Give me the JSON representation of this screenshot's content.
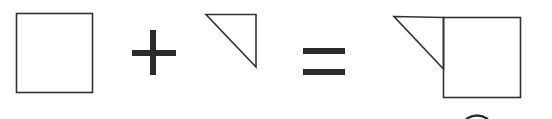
{
  "diagram": {
    "colors": {
      "background": "#ffffff",
      "stroke": "#333333",
      "operator": "#2b2b2b"
    },
    "elements": [
      {
        "id": "square",
        "label": "square",
        "shape": "rect",
        "x": 16,
        "y": 13,
        "w": 76,
        "h": 79
      },
      {
        "id": "plus",
        "label": "+",
        "shape": "plus-sign"
      },
      {
        "id": "triangle",
        "label": "right triangle",
        "shape": "polygon",
        "points": [
          [
            206,
            14
          ],
          [
            256,
            14
          ],
          [
            256,
            67
          ]
        ]
      },
      {
        "id": "equals",
        "label": "=",
        "shape": "equals-sign"
      },
      {
        "id": "composite",
        "label": "triangle attached to square",
        "shape": "composite",
        "triangle_points": [
          [
            394,
            16
          ],
          [
            443,
            17
          ],
          [
            443,
            69
          ]
        ],
        "square": {
          "x": 443,
          "y": 17,
          "w": 77,
          "h": 80
        }
      }
    ],
    "equation_text": "square + triangle = composite"
  }
}
